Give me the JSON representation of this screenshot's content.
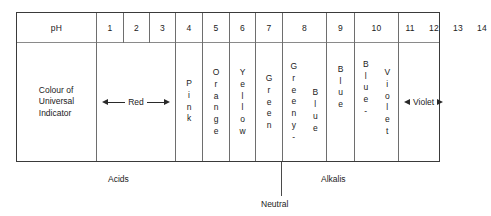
{
  "chart_data": {
    "type": "table",
    "row_header_labels": [
      "pH",
      "Colour of\nUniversal\nIndicator"
    ],
    "ph_values": [
      "1",
      "2",
      "3",
      "4",
      "5",
      "6",
      "7",
      "8",
      "9",
      "10",
      "11",
      "12",
      "13",
      "14"
    ],
    "colours": [
      {
        "ph": "1-3",
        "label": "Red",
        "style": "arrow"
      },
      {
        "ph": "4",
        "label": "Pink",
        "style": "vertical"
      },
      {
        "ph": "5",
        "label": "Orange",
        "style": "vertical"
      },
      {
        "ph": "6",
        "label": "Yellow",
        "style": "vertical"
      },
      {
        "ph": "7",
        "label": "Green",
        "style": "vertical"
      },
      {
        "ph": "8",
        "label": "Greeny-Blue",
        "style": "vertical-split",
        "part1": "Greeny-",
        "part2": "Blue"
      },
      {
        "ph": "9",
        "label": "Blue",
        "style": "vertical"
      },
      {
        "ph": "10",
        "label": "Blue-Violet",
        "style": "vertical-split",
        "part1": "Blue-",
        "part2": "Violet"
      },
      {
        "ph": "11-14",
        "label": "Violet",
        "style": "arrow"
      }
    ],
    "regions": [
      {
        "name": "Acids",
        "ph_range": "1-6"
      },
      {
        "name": "Neutral",
        "ph_range": "7"
      },
      {
        "name": "Alkalis",
        "ph_range": "8-14"
      }
    ],
    "xlabel": "pH",
    "ylabel": "",
    "grid": true,
    "legend": "none"
  },
  "table": {
    "header": {
      "ph_label": "pH",
      "values": [
        "1",
        "2",
        "3",
        "4",
        "5",
        "6",
        "7",
        "8",
        "9",
        "10",
        "11",
        "12",
        "13",
        "14"
      ]
    },
    "body": {
      "row_label": "Colour of\nUniversal\nIndicator",
      "red_label": "Red",
      "pink_label": "Pink",
      "orange_label": "Orange",
      "yellow_label": "Yellow",
      "green_label": "Green",
      "greeny_label": "Greeny-",
      "blue8_label": "Blue",
      "blue9_label": "Blue",
      "blue10_label": "Blue-",
      "violet10_label": "Violet",
      "violet_label": "Violet"
    }
  },
  "footer": {
    "acids_label": "Acids",
    "neutral_label": "Neutral",
    "alkalis_label": "Alkalis"
  },
  "colors": {
    "frame": "#3a3a3a",
    "divider": "#6e6e6e",
    "header_rule": "#8a8a8a",
    "text": "#222222",
    "background": "#ffffff"
  }
}
